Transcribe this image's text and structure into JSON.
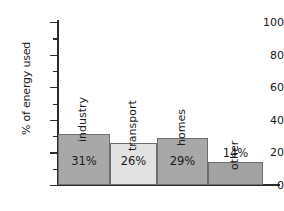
{
  "chart_data": {
    "type": "bar",
    "title": "",
    "xlabel": "",
    "ylabel": "% of energy used",
    "categories": [
      "industry",
      "transport",
      "homes",
      "other"
    ],
    "values": [
      31,
      26,
      29,
      14
    ],
    "value_labels": [
      "31%",
      "26%",
      "29%",
      "14%"
    ],
    "ylim": [
      0,
      100
    ],
    "ytick_labels": [
      "0",
      "20",
      "40",
      "60",
      "80",
      "100"
    ],
    "ytick_values": [
      0,
      20,
      40,
      60,
      80,
      100
    ],
    "minor_tick_values": [
      10,
      30,
      50,
      70,
      90
    ],
    "grid": false,
    "legend": "none",
    "bar_colors": [
      "#a8a8a8",
      "#e2e2e2",
      "#a8a8a8",
      "#a2a2a2"
    ],
    "bar_edge_color": "#6e6e6e",
    "axis_color": "#2b2b2b",
    "background": "#ffffff"
  }
}
